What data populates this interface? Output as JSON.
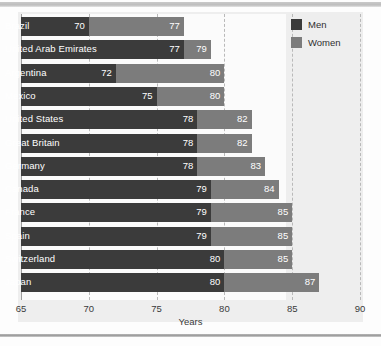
{
  "chart_data": {
    "type": "bar",
    "orientation": "horizontal",
    "title": "",
    "xlabel": "Years",
    "ylabel": "",
    "xlim": [
      65,
      90
    ],
    "xticks": [
      65,
      70,
      75,
      80,
      85,
      90
    ],
    "grid": "vertical-dashed",
    "legend_position": "top-right",
    "categories": [
      "Brazil",
      "United Arab Emirates",
      "Argentina",
      "Mexico",
      "United States",
      "Great Britain",
      "Germany",
      "Canada",
      "France",
      "Spain",
      "Switzerland",
      "Japan"
    ],
    "series": [
      {
        "name": "Men",
        "color": "#3b3b3b",
        "values": [
          70,
          77,
          72,
          75,
          78,
          78,
          78,
          79,
          79,
          79,
          80,
          80
        ]
      },
      {
        "name": "Women",
        "color": "#7c7c7c",
        "values": [
          77,
          79,
          80,
          80,
          82,
          82,
          83,
          84,
          85,
          85,
          85,
          87
        ]
      }
    ]
  },
  "legend": {
    "items": [
      {
        "label": "Men",
        "color": "#3b3b3b"
      },
      {
        "label": "Women",
        "color": "#7c7c7c"
      }
    ]
  },
  "axis": {
    "title": "Years",
    "ticks": [
      "65",
      "70",
      "75",
      "80",
      "85",
      "90"
    ]
  }
}
